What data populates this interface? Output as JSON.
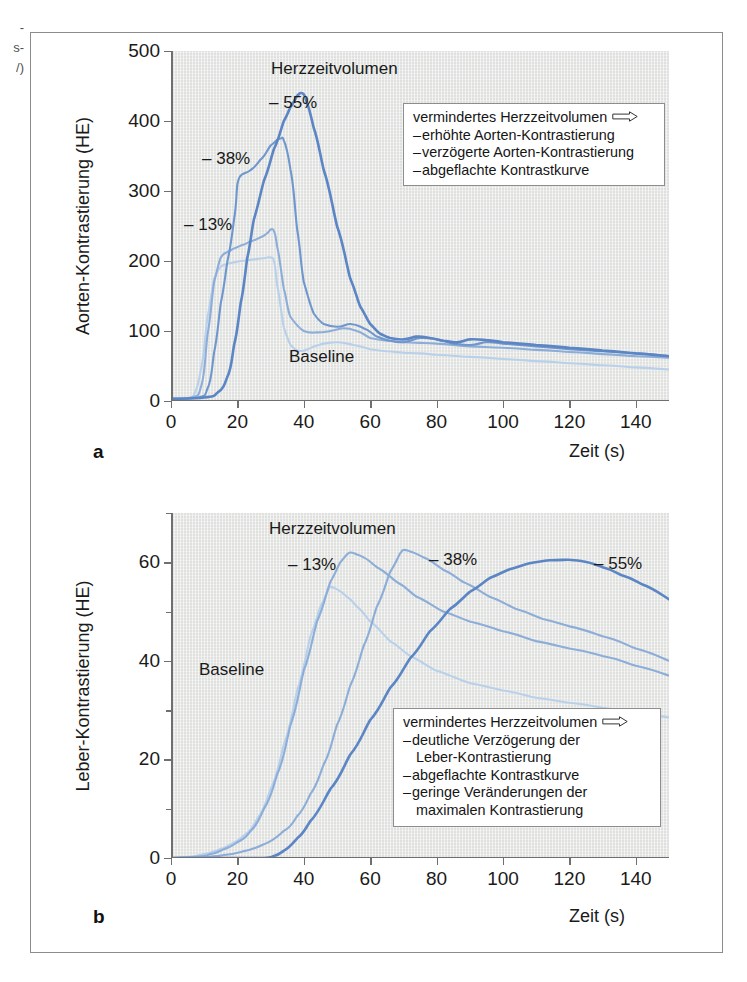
{
  "margin_text": [
    "-",
    "s-",
    "/)"
  ],
  "figure": {
    "panels": [
      {
        "letter": "a",
        "y_axis_title": "Aorten-Kontrastierung (HE)",
        "x_axis_title": "Zeit (s)",
        "series_group_label": "Herzzeitvolumen",
        "baseline_label": "Baseline",
        "curve_labels": [
          "– 55%",
          "– 38%",
          "– 13%"
        ],
        "legend": {
          "heading": "vermindertes Herzzeitvolumen",
          "arrow": "right-arrow-icon",
          "items": [
            "erhöhte Aorten-Kontrastierung",
            "verzögerte Aorten-Kontrastierung",
            "abgeflachte Kontrastkurve"
          ]
        }
      },
      {
        "letter": "b",
        "y_axis_title": "Leber-Kontrastierung (HE)",
        "x_axis_title": "Zeit (s)",
        "series_group_label": "Herzzeitvolumen",
        "baseline_label": "Baseline",
        "curve_labels": [
          "– 13%",
          "– 38%",
          "– 55%"
        ],
        "legend": {
          "heading": "vermindertes Herzzeitvolumen",
          "arrow": "right-arrow-icon",
          "items": [
            "deutliche Verzögerung der",
            "Leber-Kontrastierung",
            "abgeflachte Kontrastkurve",
            "geringe Veränderungen der",
            "maximalen Kontrastierung"
          ]
        }
      }
    ]
  },
  "colors": {
    "curve_darkest": "#5b85c4",
    "curve_dark": "#6f96cd",
    "curve_mid": "#8dadd9",
    "curve_light": "#b9d0ea",
    "plot_background": "#dfe1de",
    "axis": "#6f6f6f",
    "frame": "#8d8d8d",
    "text": "#1a1a1a"
  },
  "chart_data": [
    {
      "type": "line",
      "title": "",
      "panel": "a",
      "xlabel": "Zeit (s)",
      "ylabel": "Aorten-Kontrastierung (HE)",
      "xlim": [
        0,
        150
      ],
      "ylim": [
        0,
        500
      ],
      "xticks": [
        0,
        20,
        40,
        60,
        80,
        100,
        120,
        140
      ],
      "yticks": [
        0,
        100,
        200,
        300,
        400,
        500
      ],
      "grid": false,
      "legend_position": "inside-top-right",
      "annotations": [
        "Herzzeitvolumen",
        "Baseline",
        "– 55%",
        "– 38%",
        "– 13%"
      ],
      "series": [
        {
          "name": "– 13%",
          "color": "#b9d0ea",
          "peak": {
            "x": 30,
            "y": 205
          },
          "x": [
            0,
            5,
            7,
            9,
            11,
            13,
            15,
            17,
            19,
            21,
            23,
            26,
            28,
            29,
            30,
            31,
            32,
            34,
            36,
            38,
            40,
            43,
            46,
            50,
            55,
            60,
            65,
            70,
            75,
            80,
            90,
            100,
            110,
            120,
            130,
            140,
            150
          ],
          "y": [
            3,
            4,
            10,
            45,
            120,
            175,
            192,
            196,
            198,
            200,
            201,
            203,
            204,
            205,
            205,
            200,
            165,
            105,
            80,
            72,
            72,
            78,
            82,
            84,
            80,
            74,
            71,
            69,
            68,
            66,
            63,
            60,
            57,
            54,
            51,
            48,
            45
          ]
        },
        {
          "name": "– 13% upper",
          "color": "#8dadd9",
          "peak": {
            "x": 30,
            "y": 245
          },
          "x": [
            0,
            6,
            9,
            11,
            13,
            15,
            17,
            19,
            21,
            24,
            27,
            29,
            30,
            31,
            32,
            34,
            36,
            40,
            44,
            48,
            52,
            56,
            60,
            65,
            70,
            75,
            80,
            90,
            100,
            110,
            120,
            130,
            140,
            150
          ],
          "y": [
            3,
            5,
            20,
            95,
            170,
            205,
            213,
            218,
            222,
            228,
            234,
            240,
            245,
            243,
            220,
            160,
            120,
            100,
            98,
            100,
            104,
            100,
            90,
            86,
            84,
            83,
            82,
            78,
            76,
            73,
            70,
            67,
            64,
            62
          ]
        },
        {
          "name": "– 38%",
          "color": "#6f96cd",
          "peak": {
            "x": 33,
            "y": 375
          },
          "x": [
            0,
            8,
            11,
            13,
            15,
            17,
            19,
            20,
            21,
            22,
            24,
            27,
            30,
            32,
            33,
            34,
            36,
            38,
            40,
            43,
            46,
            50,
            54,
            58,
            62,
            66,
            70,
            75,
            80,
            85,
            90,
            95,
            100,
            110,
            120,
            130,
            140,
            150
          ],
          "y": [
            3,
            5,
            18,
            70,
            140,
            200,
            260,
            310,
            322,
            325,
            330,
            345,
            365,
            373,
            375,
            372,
            330,
            245,
            170,
            125,
            110,
            106,
            110,
            104,
            92,
            86,
            84,
            90,
            88,
            82,
            80,
            84,
            82,
            78,
            74,
            71,
            68,
            64
          ]
        },
        {
          "name": "– 55%",
          "color": "#5b85c4",
          "peak": {
            "x": 39,
            "y": 440
          },
          "x": [
            0,
            10,
            14,
            17,
            19,
            21,
            23,
            25,
            28,
            31,
            34,
            36,
            38,
            39,
            40,
            41,
            43,
            46,
            50,
            54,
            57,
            60,
            63,
            66,
            70,
            74,
            78,
            82,
            86,
            90,
            95,
            100,
            110,
            120,
            130,
            140,
            150
          ],
          "y": [
            3,
            5,
            12,
            35,
            80,
            140,
            205,
            260,
            315,
            360,
            400,
            420,
            436,
            440,
            438,
            425,
            390,
            330,
            250,
            175,
            135,
            110,
            96,
            90,
            88,
            92,
            90,
            86,
            84,
            88,
            87,
            84,
            80,
            76,
            72,
            68,
            64
          ]
        }
      ]
    },
    {
      "type": "line",
      "title": "",
      "panel": "b",
      "xlabel": "Zeit (s)",
      "ylabel": "Leber-Kontrastierung (HE)",
      "xlim": [
        0,
        150
      ],
      "ylim": [
        0,
        70
      ],
      "xticks": [
        0,
        20,
        40,
        60,
        80,
        100,
        120,
        140
      ],
      "yticks": [
        0,
        20,
        40,
        60
      ],
      "yticks_minor": [
        10,
        30,
        50,
        70
      ],
      "grid": false,
      "legend_position": "inside-bottom-right",
      "annotations": [
        "Herzzeitvolumen",
        "Baseline",
        "– 13%",
        "– 38%",
        "– 55%"
      ],
      "series": [
        {
          "name": "– 13% lower",
          "color": "#b9d0ea",
          "peak": {
            "x": 48,
            "y": 55
          },
          "x": [
            0,
            6,
            10,
            14,
            18,
            22,
            26,
            30,
            34,
            38,
            42,
            45,
            47,
            48,
            50,
            53,
            56,
            60,
            66,
            72,
            80,
            90,
            100,
            110,
            120,
            130,
            140,
            150
          ],
          "y": [
            0,
            0.3,
            0.8,
            1.6,
            2.8,
            4.6,
            8,
            14,
            23,
            34,
            45,
            51,
            54,
            55,
            54.5,
            53,
            51,
            48,
            44,
            41,
            38,
            35.5,
            34,
            32.5,
            31.5,
            30.5,
            29.5,
            28.5
          ]
        },
        {
          "name": "– 13%",
          "color": "#8dadd9",
          "peak": {
            "x": 54,
            "y": 62
          },
          "x": [
            0,
            8,
            12,
            16,
            20,
            24,
            28,
            32,
            36,
            40,
            44,
            48,
            51,
            53,
            54,
            56,
            58,
            62,
            68,
            74,
            82,
            90,
            100,
            110,
            120,
            130,
            140,
            150
          ],
          "y": [
            0,
            0.3,
            0.8,
            1.8,
            3.2,
            5.5,
            10,
            17,
            27,
            38,
            48,
            56,
            60,
            61.6,
            62,
            61.6,
            61,
            59,
            56,
            53,
            50,
            48,
            46,
            44,
            42.5,
            41,
            39,
            37
          ]
        },
        {
          "name": "– 38%",
          "color": "#8dadd9",
          "peak": {
            "x": 70,
            "y": 62.5
          },
          "x": [
            0,
            10,
            16,
            22,
            28,
            34,
            38,
            42,
            46,
            50,
            54,
            58,
            62,
            66,
            69,
            70,
            72,
            76,
            82,
            88,
            96,
            104,
            112,
            120,
            130,
            140,
            150
          ],
          "y": [
            0,
            0.2,
            0.6,
            1.4,
            2.8,
            5.5,
            8.5,
            13,
            19,
            27,
            35,
            43,
            51,
            58,
            61.8,
            62.5,
            62.2,
            61,
            58.5,
            56,
            53,
            50.5,
            48.5,
            47,
            45,
            42.5,
            40
          ]
        },
        {
          "name": "– 55%",
          "color": "#5b85c4",
          "peak": {
            "x": 120,
            "y": 60.5
          },
          "x": [
            0,
            14,
            22,
            28,
            31,
            34,
            38,
            42,
            48,
            54,
            60,
            66,
            72,
            78,
            84,
            90,
            96,
            102,
            108,
            114,
            119,
            120,
            124,
            130,
            136,
            142,
            150
          ],
          "y": [
            0,
            0,
            0,
            0,
            0.4,
            1.5,
            4,
            7.5,
            14,
            21,
            28,
            34.5,
            40.5,
            46,
            50.5,
            54,
            56.8,
            58.6,
            59.8,
            60.4,
            60.5,
            60.5,
            60.2,
            59,
            57.3,
            55.5,
            52.5
          ]
        }
      ]
    }
  ]
}
